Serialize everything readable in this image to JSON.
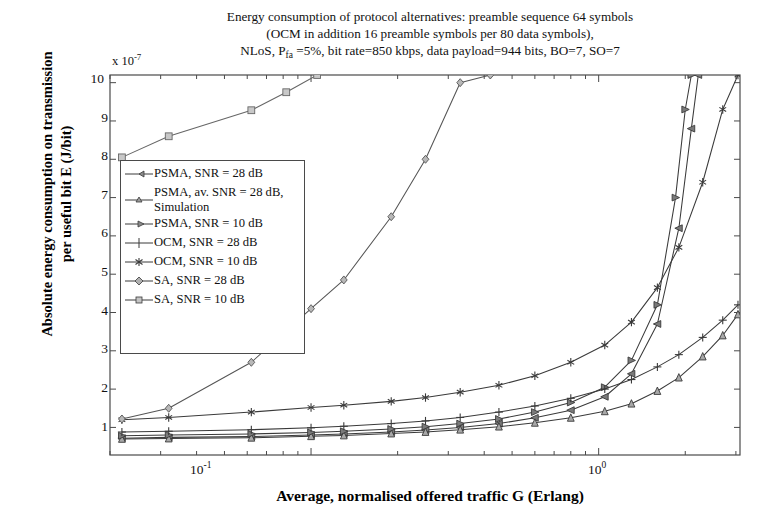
{
  "chart_data": {
    "type": "line",
    "title_lines": [
      "Energy consumption of protocol alternatives: preamble sequence 64 symbols",
      "(OCM in addition 16 preamble symbols per 80 data symbols),",
      "NLoS, P_fa =5%, bit rate=850 kbps, data payload=944 bits, BO=7, SO=7"
    ],
    "title_line3_pre": "NLoS, P",
    "title_line3_sub": "fa",
    "title_line3_post": " =5%, bit rate=850 kbps, data payload=944 bits, BO=7, SO=7",
    "xlabel": "Average, normalised offered traffic G (Erlang)",
    "ylabel": "Absolute energy consumption on transmission per useful bit E (J/bit)",
    "ylabel_line1": "Absolute energy consumption on transmission",
    "ylabel_line2": "per useful bit E (J/bit)",
    "y_multiplier": "x 10",
    "y_multiplier_exp": "-7",
    "xscale": "log",
    "yscale": "linear",
    "xlim": [
      0.02,
      3.1
    ],
    "ylim": [
      0.28,
      10.2
    ],
    "grid": false,
    "legend_position": "center-left inside axes",
    "xtick_labels": [
      "10",
      "10"
    ],
    "xtick_exps": [
      "-1",
      "0"
    ],
    "xtick_values": [
      0.1,
      1.0
    ],
    "ytick_labels": [
      "1",
      "2",
      "3",
      "4",
      "5",
      "6",
      "7",
      "8",
      "9",
      "10"
    ],
    "ytick_values": [
      1,
      2,
      3,
      4,
      5,
      6,
      7,
      8,
      9,
      10
    ],
    "y_units": "1e-7 J/bit",
    "series": [
      {
        "name": "PSMA, SNR = 28 dB",
        "marker": "left-triangle",
        "color": "#3a3a3a",
        "x": [
          0.022,
          0.032,
          0.062,
          0.1,
          0.13,
          0.19,
          0.25,
          0.33,
          0.45,
          0.6,
          0.8,
          1.05,
          1.3,
          1.6,
          1.9,
          2.1,
          2.22
        ],
        "y": [
          0.72,
          0.74,
          0.76,
          0.8,
          0.83,
          0.88,
          0.93,
          1.0,
          1.1,
          1.25,
          1.45,
          1.8,
          2.4,
          3.7,
          6.2,
          8.8,
          10.2
        ]
      },
      {
        "name": "PSMA, av. SNR = 28 dB, Simulation",
        "marker": "up-triangle",
        "color": "#3a3a3a",
        "x": [
          0.022,
          0.032,
          0.062,
          0.1,
          0.13,
          0.19,
          0.25,
          0.33,
          0.45,
          0.6,
          0.8,
          1.05,
          1.3,
          1.6,
          1.9,
          2.3,
          2.7,
          3.05
        ],
        "y": [
          0.7,
          0.71,
          0.73,
          0.77,
          0.79,
          0.84,
          0.88,
          0.94,
          1.02,
          1.12,
          1.25,
          1.42,
          1.62,
          1.95,
          2.3,
          2.85,
          3.4,
          3.95
        ]
      },
      {
        "name": "PSMA, SNR = 10 dB",
        "marker": "right-triangle",
        "color": "#3a3a3a",
        "x": [
          0.022,
          0.032,
          0.062,
          0.1,
          0.13,
          0.19,
          0.25,
          0.33,
          0.45,
          0.6,
          0.8,
          1.05,
          1.3,
          1.6,
          1.85,
          2.0,
          2.1
        ],
        "y": [
          0.78,
          0.8,
          0.83,
          0.87,
          0.9,
          0.96,
          1.02,
          1.1,
          1.22,
          1.4,
          1.65,
          2.05,
          2.75,
          4.2,
          7.0,
          9.3,
          10.2
        ]
      },
      {
        "name": "OCM, SNR = 28 dB",
        "marker": "plus",
        "color": "#3a3a3a",
        "x": [
          0.022,
          0.032,
          0.062,
          0.1,
          0.13,
          0.19,
          0.25,
          0.33,
          0.45,
          0.6,
          0.8,
          1.05,
          1.3,
          1.6,
          1.9,
          2.3,
          2.7,
          3.05
        ],
        "y": [
          0.88,
          0.9,
          0.94,
          0.99,
          1.03,
          1.1,
          1.17,
          1.26,
          1.4,
          1.56,
          1.76,
          2.0,
          2.25,
          2.58,
          2.9,
          3.35,
          3.8,
          4.2
        ]
      },
      {
        "name": "OCM, SNR = 10 dB",
        "marker": "star",
        "color": "#3a3a3a",
        "x": [
          0.022,
          0.032,
          0.062,
          0.1,
          0.13,
          0.19,
          0.25,
          0.33,
          0.45,
          0.6,
          0.8,
          1.05,
          1.3,
          1.6,
          1.9,
          2.3,
          2.7,
          3.05
        ],
        "y": [
          1.2,
          1.26,
          1.4,
          1.52,
          1.58,
          1.68,
          1.78,
          1.92,
          2.1,
          2.35,
          2.7,
          3.15,
          3.75,
          4.65,
          5.7,
          7.4,
          9.3,
          10.2
        ]
      },
      {
        "name": "SA, SNR = 28 dB",
        "marker": "diamond",
        "color": "#555555",
        "x": [
          0.022,
          0.032,
          0.062,
          0.1,
          0.13,
          0.19,
          0.25,
          0.33,
          0.42
        ],
        "y": [
          1.22,
          1.5,
          2.7,
          4.1,
          4.85,
          6.5,
          8.0,
          10.0,
          10.2
        ]
      },
      {
        "name": "SA, SNR = 10 dB",
        "marker": "square",
        "color": "#666666",
        "x": [
          0.022,
          0.032,
          0.062,
          0.082,
          0.105
        ],
        "y": [
          8.05,
          8.6,
          9.28,
          9.75,
          10.2
        ]
      }
    ]
  },
  "legend": {
    "items": [
      {
        "label": "PSMA, SNR = 28 dB",
        "marker": "left-triangle"
      },
      {
        "label": "PSMA, av. SNR = 28 dB, Simulation",
        "marker": "up-triangle"
      },
      {
        "label": "PSMA, SNR = 10 dB",
        "marker": "right-triangle"
      },
      {
        "label": "OCM, SNR = 28 dB",
        "marker": "plus"
      },
      {
        "label": "OCM, SNR = 10 dB",
        "marker": "star"
      },
      {
        "label": "SA, SNR = 28 dB",
        "marker": "diamond"
      },
      {
        "label": "SA, SNR = 10 dB",
        "marker": "square"
      }
    ]
  },
  "colors": {
    "axis": "#4a4a4a",
    "line": "#3a3a3a",
    "background": "#ffffff",
    "text": "#111111"
  }
}
